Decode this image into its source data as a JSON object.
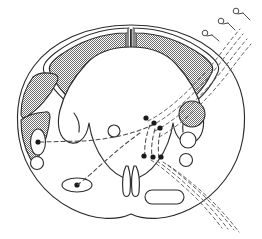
{
  "figure": {
    "background_color": "#ffffff",
    "line_color": "#2b2b2b",
    "shading_color": "#808080",
    "fiber_color": "#4a4a4a",
    "width": 262,
    "height": 239
  },
  "regions": {
    "dorsal_funiculus_left": "dorsal-column-left",
    "dorsal_funiculus_right": "dorsal-column-right",
    "lateral_tract_upper_left": "lateral-funiculus-upper-left",
    "lateral_tract_lower_left": "lateral-funiculus-lower-left",
    "gray_matter": "butterfly-gray-matter",
    "central_canal": "central-canal",
    "ventral_median_fissure": "ventral-median-fissure"
  },
  "cells": {
    "interneuron_left": "interneuron-left",
    "small_neuron_left": "small-neuron-left",
    "motor_neuron_ventral": "motor-neuron-ventral",
    "tract_cell_shaded_right": "tract-cell-right-shaded",
    "tract_cell_open_upper_right": "tract-cell-right-open-upper",
    "tract_cell_open_lower_right": "tract-cell-right-open-lower",
    "intermediate_cell": "intermediate-neuron",
    "ventral_cell_group": "ventral-cell-group"
  },
  "pathways": {
    "dorsal_root_entry": "dorsal-root-afferent-bundle",
    "ventral_root_exit": "ventral-root-efferent-bundle",
    "commissural_fiber": "commissural-dashed-fiber",
    "descending_collateral": "descending-collateral-fiber"
  },
  "receptors": {
    "count": 3,
    "items": [
      {
        "name": "sensory-receptor-1"
      },
      {
        "name": "sensory-receptor-2"
      },
      {
        "name": "sensory-receptor-3"
      }
    ]
  },
  "boutons": {
    "upper_cluster_count": 3,
    "lower_cluster_count": 3
  }
}
